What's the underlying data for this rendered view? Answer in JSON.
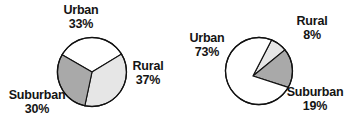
{
  "figure": {
    "background_color": "#ffffff",
    "text_color": "#141414",
    "outline_color": "#111111"
  },
  "palette": {
    "white_slice": "#ffffff",
    "light_grey_slice": "#e6e6e6",
    "medium_grey_slice": "#a9a9a9"
  },
  "chart_data": [
    {
      "type": "pie",
      "id": "chart-left",
      "title": "",
      "labels": [
        "Urban",
        "Rural",
        "Suburban"
      ],
      "values": [
        33,
        37,
        30
      ],
      "value_labels": [
        "33%",
        "37%",
        "30%"
      ],
      "colors": [
        "#ffffff",
        "#e6e6e6",
        "#a9a9a9"
      ],
      "start_angle_deg": -60,
      "direction": "clockwise",
      "legend": "none",
      "labels_position": "outside-callout",
      "slices": [
        {
          "label": "Urban",
          "value": 33,
          "value_label": "33%",
          "color": "#ffffff"
        },
        {
          "label": "Rural",
          "value": 37,
          "value_label": "37%",
          "color": "#e6e6e6"
        },
        {
          "label": "Suburban",
          "value": 30,
          "value_label": "30%",
          "color": "#a9a9a9"
        }
      ]
    },
    {
      "type": "pie",
      "id": "chart-right",
      "title": "",
      "labels": [
        "Urban",
        "Rural",
        "Suburban"
      ],
      "values": [
        73,
        8,
        19
      ],
      "value_labels": [
        "73%",
        "8%",
        "19%"
      ],
      "colors": [
        "#ffffff",
        "#e6e6e6",
        "#a9a9a9"
      ],
      "start_angle_deg": 22,
      "direction": "clockwise",
      "legend": "none",
      "labels_position": "outside-callout",
      "slices": [
        {
          "label": "Rural",
          "value": 8,
          "value_label": "8%",
          "color": "#e6e6e6"
        },
        {
          "label": "Suburban",
          "value": 19,
          "value_label": "19%",
          "color": "#a9a9a9"
        },
        {
          "label": "Urban",
          "value": 73,
          "value_label": "73%",
          "color": "#ffffff"
        }
      ]
    }
  ],
  "chart_left": {
    "urban": {
      "category": "Urban",
      "percent": "33%"
    },
    "rural": {
      "category": "Rural",
      "percent": "37%"
    },
    "suburban": {
      "category": "Suburban",
      "percent": "30%"
    }
  },
  "chart_right": {
    "urban": {
      "category": "Urban",
      "percent": "73%"
    },
    "rural": {
      "category": "Rural",
      "percent": "8%"
    },
    "suburban": {
      "category": "Suburban",
      "percent": "19%"
    }
  }
}
